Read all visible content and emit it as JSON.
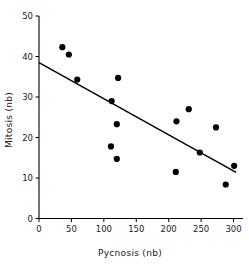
{
  "chart_data": {
    "type": "scatter",
    "title": "",
    "xlabel": "Pycnosis (nb)",
    "ylabel": "Mitosis (nb)",
    "xlim": [
      0,
      310
    ],
    "ylim": [
      0,
      50
    ],
    "xticks": [
      0,
      50,
      100,
      150,
      200,
      250,
      300
    ],
    "yticks": [
      0,
      10,
      20,
      30,
      40,
      50
    ],
    "xtick_labels": [
      "0",
      "50",
      "100",
      "150",
      "200",
      "250",
      "300"
    ],
    "ytick_labels": [
      "0",
      "10",
      "20",
      "30",
      "40",
      "50"
    ],
    "grid": false,
    "legend": "none",
    "marker": "filled-circle",
    "marker_color": "#000000",
    "marker_size": 3.1,
    "points": [
      {
        "x": 36,
        "y": 42.3
      },
      {
        "x": 46,
        "y": 40.5
      },
      {
        "x": 59,
        "y": 34.3
      },
      {
        "x": 111,
        "y": 17.8
      },
      {
        "x": 112,
        "y": 29.0
      },
      {
        "x": 120,
        "y": 23.3
      },
      {
        "x": 120,
        "y": 14.7
      },
      {
        "x": 122,
        "y": 34.7
      },
      {
        "x": 211,
        "y": 11.5
      },
      {
        "x": 212,
        "y": 24.0
      },
      {
        "x": 231,
        "y": 27.0
      },
      {
        "x": 248,
        "y": 16.3
      },
      {
        "x": 273,
        "y": 22.5
      },
      {
        "x": 288,
        "y": 8.4
      },
      {
        "x": 301,
        "y": 13.0
      }
    ],
    "fit_line": {
      "kind": "linear-regression",
      "color": "#000000",
      "x_start": 0,
      "y_start": 38.5,
      "x_end": 304,
      "y_end": 11.4
    }
  }
}
